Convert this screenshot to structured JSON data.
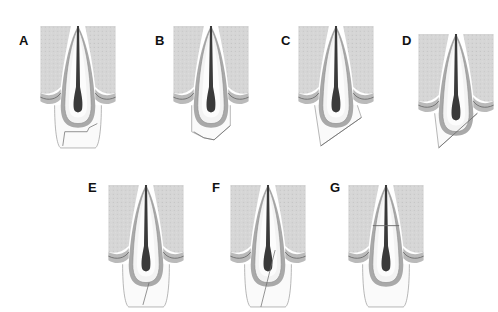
{
  "figure": {
    "colors": {
      "background": "#ffffff",
      "bone": "#d6d6d6",
      "gingiva_band": "#a9a9a9",
      "root_outline": "#8a8a8a",
      "dentin": "#f3f3f3",
      "pulp": "#3a3a3a",
      "crown_outline": "#9a9a9a",
      "fracture_line": "#6a6a6a",
      "label": "#111111"
    },
    "panels": [
      {
        "label": "A",
        "x": 40,
        "y": 26,
        "fracture": "crown-horizontal-and-oblique"
      },
      {
        "label": "B",
        "x": 173,
        "y": 26,
        "fracture": "crown-oblique-incisal"
      },
      {
        "label": "C",
        "x": 298,
        "y": 26,
        "fracture": "crown-root-oblique"
      },
      {
        "label": "D",
        "x": 418,
        "y": 34,
        "fracture": "crown-root-oblique-deep"
      },
      {
        "label": "E",
        "x": 108,
        "y": 185,
        "fracture": "crown-vertical-short"
      },
      {
        "label": "F",
        "x": 230,
        "y": 185,
        "fracture": "crown-root-vertical"
      },
      {
        "label": "G",
        "x": 348,
        "y": 185,
        "fracture": "root-horizontal"
      }
    ],
    "label_positions": [
      {
        "label": "A",
        "x": 19,
        "y": 33
      },
      {
        "label": "B",
        "x": 155,
        "y": 33
      },
      {
        "label": "C",
        "x": 281,
        "y": 33
      },
      {
        "label": "D",
        "x": 402,
        "y": 33
      },
      {
        "label": "E",
        "x": 88,
        "y": 180
      },
      {
        "label": "F",
        "x": 212,
        "y": 180
      },
      {
        "label": "G",
        "x": 330,
        "y": 180
      }
    ]
  }
}
